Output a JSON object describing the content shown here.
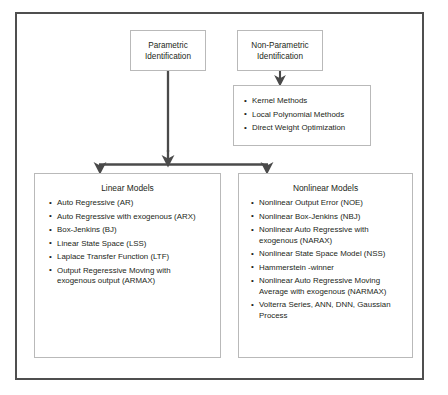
{
  "diagram": {
    "colors": {
      "frame_border": "#4f4f4f",
      "box_border": "#b9b9b9",
      "connector": "#4a4a4a",
      "text": "#231f20",
      "background": "#ffffff"
    },
    "nodes": {
      "parametric": {
        "label_line1": "Parametric",
        "label_line2": "Identification"
      },
      "nonparametric": {
        "label_line1": "Non-Parametric",
        "label_line2": "Identification"
      },
      "nonparametric_methods": {
        "items": [
          "Kernel Methods",
          "Local Polynomial Methods",
          "Direct Weight Optimization"
        ]
      },
      "linear_models": {
        "title": "Linear Models",
        "items": [
          "Auto Regressive (AR)",
          "Auto Regressive with exogenous (ARX)",
          "Box-Jenkins (BJ)",
          "Linear State Space (LSS)",
          "Laplace Transfer Function (LTF)",
          "Output Regeressive Moving with exogenous output (ARMAX)"
        ]
      },
      "nonlinear_models": {
        "title": "Nonlinear Models",
        "items": [
          "Nonlinear Output Error (NOE)",
          "Nonlinear Box-Jenkins (NBJ)",
          "Nonlinear Auto Regressive with exogenous (NARAX)",
          "Nonlinear State Space Model (NSS)",
          "Hammerstein -winner",
          "Nonlinear Auto Regressive Moving Average with exogenous (NARMAX)",
          "Volterra Series, ANN, DNN, Gaussian Process"
        ]
      }
    },
    "connectors": [
      {
        "name": "nonparametric-to-methods",
        "from": "nonparametric",
        "to": "nonparametric_methods"
      },
      {
        "name": "parametric-to-linear",
        "from": "parametric",
        "to": "linear_models"
      },
      {
        "name": "parametric-to-nonlinear",
        "from": "parametric",
        "to": "nonlinear_models"
      }
    ],
    "caption": ""
  }
}
